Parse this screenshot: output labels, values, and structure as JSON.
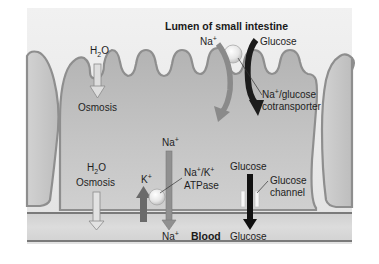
{
  "diagram": {
    "title": "Lumen of small intestine",
    "regions": {
      "lumen": "Lumen of small intestine",
      "blood": "Blood"
    },
    "labels": {
      "h2o_top": {
        "base": "H",
        "sub": "2",
        "tail": "O"
      },
      "osmosis_top": "Osmosis",
      "na_lumen": {
        "base": "Na",
        "sup": "+"
      },
      "glucose_lumen": "Glucose",
      "cotransporter_line1": {
        "base": "Na",
        "sup": "+",
        "tail": "/glucose"
      },
      "cotransporter_line2": "cotransporter",
      "h2o_bottom": {
        "base": "H",
        "sub": "2",
        "tail": "O"
      },
      "osmosis_bottom": "Osmosis",
      "k_ion": {
        "base": "K",
        "sup": "+"
      },
      "na_cell": {
        "base": "Na",
        "sup": "+"
      },
      "atpase_line1": {
        "a": "Na",
        "sup1": "+",
        "mid": "/K",
        "sup2": "+"
      },
      "atpase_line2": "ATPase",
      "na_blood": {
        "base": "Na",
        "sup": "+"
      },
      "glucose_cell": "Glucose",
      "glucose_channel_line1": "Glucose",
      "glucose_channel_line2": "channel",
      "glucose_blood": "Glucose"
    },
    "arrows": [
      {
        "id": "h2o-osmosis-apical",
        "direction": "down",
        "color": "#d9d9d9"
      },
      {
        "id": "na-cotransport",
        "direction": "down-curved",
        "color": "#8a8a8a"
      },
      {
        "id": "glucose-cotransport",
        "direction": "down-curved",
        "color": "#1c1c1c"
      },
      {
        "id": "h2o-osmosis-basal",
        "direction": "down",
        "color": "#d9d9d9"
      },
      {
        "id": "k-into-cell",
        "direction": "up",
        "color": "#6a6a6a"
      },
      {
        "id": "na-out-of-cell",
        "direction": "down",
        "color": "#8f8f8f"
      },
      {
        "id": "glucose-channel",
        "direction": "down",
        "color": "#111111"
      }
    ],
    "colors": {
      "background_box": "#e9e9e9",
      "cell_fill": "#bdbdbd",
      "cell_outline": "#8e8e8e",
      "membrane_line": "#7a7a7a",
      "blood_fill": "#d6d6d6"
    }
  }
}
